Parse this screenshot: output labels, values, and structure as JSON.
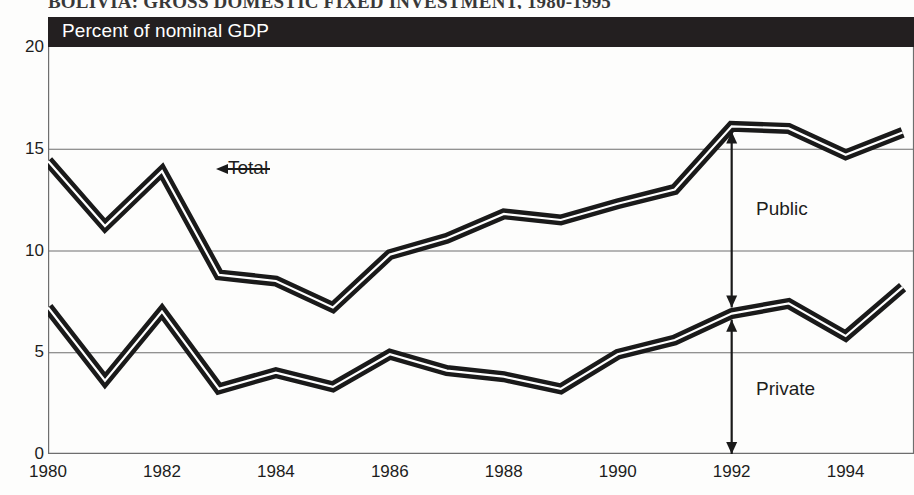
{
  "figure": {
    "title": "BOLIVIA: GROSS DOMESTIC FIXED INVESTMENT, 1980-1995",
    "units_banner": "Percent of nominal GDP"
  },
  "annotations": {
    "total": "Total",
    "public": "Public",
    "private": "Private"
  },
  "colors": {
    "banner_background": "#231f20",
    "line": "#1a1a1a",
    "line_core": "#ffffff",
    "gridline": "#6e6e6e",
    "text": "#1d1d1d",
    "page_background": "#fdfdfc"
  },
  "chart_data": {
    "type": "line",
    "title": "BOLIVIA: GROSS DOMESTIC FIXED INVESTMENT, 1980-1995",
    "subtitle": "Percent of nominal GDP",
    "xlabel": "",
    "ylabel": "Percent of nominal GDP",
    "x": [
      1980,
      1981,
      1982,
      1983,
      1984,
      1985,
      1986,
      1987,
      1988,
      1989,
      1990,
      1991,
      1992,
      1993,
      1994,
      1995
    ],
    "xlim": [
      1980,
      1995.2
    ],
    "ylim": [
      0,
      20
    ],
    "yticks": [
      0,
      5,
      10,
      15,
      20
    ],
    "xticks": [
      1980,
      1982,
      1984,
      1986,
      1988,
      1990,
      1992,
      1994
    ],
    "xtick_labels": [
      "1980",
      "1982",
      "1984",
      "1986",
      "1988",
      "1990",
      "1992",
      "1994"
    ],
    "ytick_labels": [
      "0",
      "5",
      "10",
      "15",
      "20"
    ],
    "minor_xticks_every": 1,
    "grid": "horizontal",
    "legend": "inline-annotations",
    "series": [
      {
        "name": "Total",
        "values": [
          14.4,
          11.2,
          13.9,
          8.8,
          8.5,
          7.2,
          9.8,
          10.6,
          11.8,
          11.5,
          12.3,
          13.0,
          16.1,
          16.0,
          14.7,
          15.8
        ]
      },
      {
        "name": "Private",
        "values": [
          7.2,
          3.6,
          7.0,
          3.2,
          4.0,
          3.3,
          4.9,
          4.1,
          3.8,
          3.2,
          4.9,
          5.6,
          6.9,
          7.4,
          5.8,
          8.2
        ]
      }
    ],
    "band_annotations": [
      {
        "label": "Public",
        "between": [
          "Private",
          "Total"
        ],
        "at_x": 1992
      },
      {
        "label": "Private",
        "between": [
          "baseline",
          "Private"
        ],
        "at_x": 1992
      }
    ]
  }
}
